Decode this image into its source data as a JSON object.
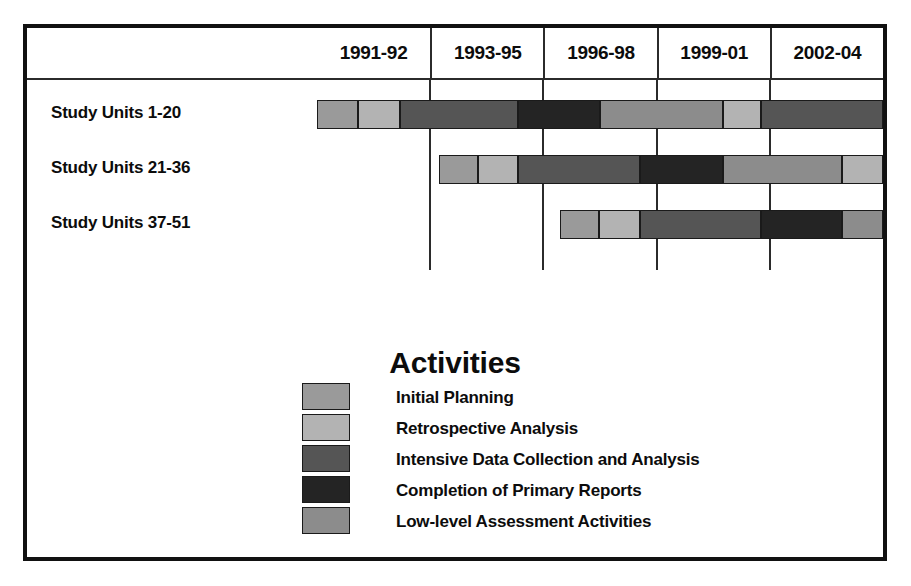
{
  "chart_data": {
    "type": "bar",
    "title": "Activities",
    "xlabel": "",
    "ylabel": "",
    "grid": true,
    "legend_position": "bottom-center",
    "periods": [
      "1991-92",
      "1993-95",
      "1996-98",
      "1999-01",
      "2002-04"
    ],
    "categories": [
      "Study Units 1-20",
      "Study Units 21-36",
      "Study Units 37-51"
    ],
    "activities": [
      {
        "key": "initial_planning",
        "label": "Initial Planning",
        "color": "#9a9a9a"
      },
      {
        "key": "retrospective_analysis",
        "label": "Retrospective Analysis",
        "color": "#b3b3b3"
      },
      {
        "key": "intensive_data",
        "label": "Intensive Data Collection and Analysis",
        "color": "#555555"
      },
      {
        "key": "completion_reports",
        "label": "Completion of Primary Reports",
        "color": "#242424"
      },
      {
        "key": "low_level_assessment",
        "label": "Low-level Assessment Activities",
        "color": "#8c8c8c"
      }
    ],
    "series": [
      {
        "name": "Study Units 1-20",
        "segments": [
          {
            "activity": "initial_planning",
            "start_pct": 0.0,
            "end_pct": 7.2
          },
          {
            "activity": "retrospective_analysis",
            "start_pct": 7.2,
            "end_pct": 14.6
          },
          {
            "activity": "intensive_data",
            "start_pct": 14.6,
            "end_pct": 35.6
          },
          {
            "activity": "completion_reports",
            "start_pct": 35.6,
            "end_pct": 50.0
          },
          {
            "activity": "low_level_assessment",
            "start_pct": 50.0,
            "end_pct": 71.8
          },
          {
            "activity": "retrospective_analysis",
            "start_pct": 71.8,
            "end_pct": 78.5
          },
          {
            "activity": "intensive_data",
            "start_pct": 78.5,
            "end_pct": 100.0
          }
        ]
      },
      {
        "name": "Study Units 21-36",
        "segments": [
          {
            "activity": "initial_planning",
            "start_pct": 21.5,
            "end_pct": 28.5
          },
          {
            "activity": "retrospective_analysis",
            "start_pct": 28.5,
            "end_pct": 35.6
          },
          {
            "activity": "intensive_data",
            "start_pct": 35.6,
            "end_pct": 57.0
          },
          {
            "activity": "completion_reports",
            "start_pct": 57.0,
            "end_pct": 71.8
          },
          {
            "activity": "low_level_assessment",
            "start_pct": 71.8,
            "end_pct": 92.8
          },
          {
            "activity": "retrospective_analysis",
            "start_pct": 92.8,
            "end_pct": 100.0
          }
        ]
      },
      {
        "name": "Study Units 37-51",
        "segments": [
          {
            "activity": "initial_planning",
            "start_pct": 42.9,
            "end_pct": 49.9
          },
          {
            "activity": "retrospective_analysis",
            "start_pct": 49.9,
            "end_pct": 57.0
          },
          {
            "activity": "intensive_data",
            "start_pct": 57.0,
            "end_pct": 78.5
          },
          {
            "activity": "completion_reports",
            "start_pct": 78.5,
            "end_pct": 92.8
          },
          {
            "activity": "low_level_assessment",
            "start_pct": 92.8,
            "end_pct": 100.0
          }
        ]
      }
    ]
  },
  "legend": {
    "title": "Activities"
  }
}
